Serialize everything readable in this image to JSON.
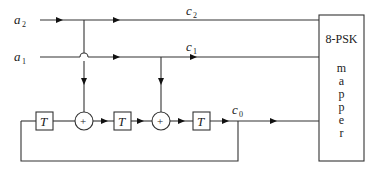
{
  "diagram": {
    "type": "trellis-coded 8-PSK encoder block diagram",
    "inputs": [
      {
        "id": "a2",
        "label": "a",
        "subscript": "2"
      },
      {
        "id": "a1",
        "label": "a",
        "subscript": "1"
      }
    ],
    "outputs": [
      {
        "id": "c2",
        "label": "c",
        "subscript": "2"
      },
      {
        "id": "c1",
        "label": "c",
        "subscript": "1"
      },
      {
        "id": "c0",
        "label": "c",
        "subscript": "0"
      }
    ],
    "delays": [
      {
        "id": "T1",
        "label": "T"
      },
      {
        "id": "T2",
        "label": "T"
      },
      {
        "id": "T3",
        "label": "T"
      }
    ],
    "adders": [
      {
        "id": "add1",
        "label": "+"
      },
      {
        "id": "add2",
        "label": "+"
      }
    ],
    "mapper": {
      "title": "8-PSK",
      "letters": [
        "m",
        "a",
        "p",
        "p",
        "e",
        "r"
      ]
    },
    "connections": [
      "a2 -> c2 -> mapper",
      "a2 -> add1 (crosses over a1 line)",
      "a1 -> c1 -> mapper",
      "a1 -> add2",
      "T1 -> add1 -> T2 -> add2 -> T3 -> c0 -> mapper",
      "c0 -> feedback -> T1"
    ]
  }
}
